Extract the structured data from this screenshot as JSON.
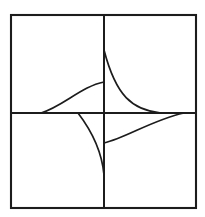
{
  "figure": {
    "canvas": {
      "width": 205,
      "height": 217
    },
    "background_color": "#ffffff",
    "stroke_color": "#1c1c1c",
    "frame": {
      "name": "outer-square",
      "left": 11,
      "top": 15,
      "right": 196,
      "bottom": 208,
      "stroke_width": 2.1
    },
    "axes": {
      "center_x": 104,
      "center_y": 113,
      "vertical": {
        "x": 104,
        "y1": 15,
        "y2": 208,
        "stroke_width": 2.0
      },
      "horizontal": {
        "y": 113,
        "x1": 11,
        "x2": 196,
        "stroke_width": 2.0
      }
    },
    "curves": [
      {
        "name": "arc-upper-right",
        "quadrant": "upper-right",
        "stroke_width": 1.7,
        "start": [
          104,
          50
        ],
        "end": [
          161,
          113
        ],
        "control_1": [
          116,
          96
        ],
        "control_2": [
          132,
          110
        ],
        "asymptote": "horizontal-axis"
      },
      {
        "name": "arc-upper-left",
        "quadrant": "upper-left",
        "stroke_width": 1.7,
        "start": [
          104,
          82
        ],
        "end": [
          41,
          113
        ],
        "control_1": [
          82,
          86
        ],
        "control_2": [
          62,
          107
        ],
        "asymptote": "horizontal-axis"
      },
      {
        "name": "arc-lower-left",
        "quadrant": "lower-left",
        "stroke_width": 1.7,
        "start": [
          78,
          113
        ],
        "end": [
          104,
          175
        ],
        "control_1": [
          91,
          130
        ],
        "control_2": [
          102,
          152
        ],
        "asymptote": "vertical-axis"
      },
      {
        "name": "arc-lower-right",
        "quadrant": "lower-right",
        "stroke_width": 1.7,
        "start": [
          104,
          143
        ],
        "end": [
          184,
          113
        ],
        "control_1": [
          126,
          138
        ],
        "control_2": [
          152,
          120
        ],
        "asymptote": "horizontal-axis"
      }
    ]
  },
  "chart_data": {
    "type": "line",
    "xlabel": "",
    "ylabel": "",
    "grid": false,
    "legend": "none",
    "axis_lines": [
      "vertical",
      "horizontal"
    ],
    "series": [
      {
        "name": "arc-upper-right",
        "quadrant": "upper-right"
      },
      {
        "name": "arc-upper-left",
        "quadrant": "upper-left"
      },
      {
        "name": "arc-lower-left",
        "quadrant": "lower-left"
      },
      {
        "name": "arc-lower-right",
        "quadrant": "lower-right"
      }
    ]
  }
}
